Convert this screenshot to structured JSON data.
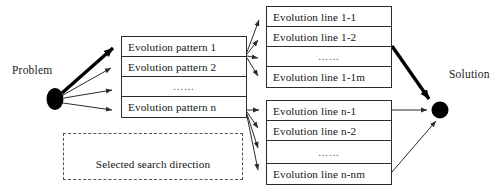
{
  "diagram": {
    "colors": {
      "stroke": "#2b2b2b",
      "thick_stroke": "#000000",
      "node_fill": "#000000",
      "legend_border": "#555555",
      "background": "#ffffff"
    },
    "nodes": {
      "problem": {
        "label": "Problem"
      },
      "solution": {
        "label": "Solution"
      }
    },
    "pattern_group": {
      "name": "evolution-pattern-group",
      "rows": [
        {
          "label": "Evolution pattern 1",
          "kind": "item"
        },
        {
          "label": "Evolution pattern 2",
          "kind": "item"
        },
        {
          "label": "……",
          "kind": "ellipsis"
        },
        {
          "label": "Evolution pattern n",
          "kind": "item"
        }
      ]
    },
    "line_group_top": {
      "name": "evolution-line-group-1",
      "rows": [
        {
          "label": "Evolution line 1-1",
          "kind": "item"
        },
        {
          "label": "Evolution line 1-2",
          "kind": "item"
        },
        {
          "label": "……",
          "kind": "ellipsis"
        },
        {
          "label": "Evolution line 1-1m",
          "kind": "item"
        }
      ]
    },
    "line_group_bottom": {
      "name": "evolution-line-group-n",
      "rows": [
        {
          "label": "Evolution line n-1",
          "kind": "item"
        },
        {
          "label": "Evolution line n-2",
          "kind": "item"
        },
        {
          "label": "……",
          "kind": "ellipsis"
        },
        {
          "label": "Evolution line n-nm",
          "kind": "item"
        }
      ]
    },
    "legend": {
      "caption": "Selected search direction"
    }
  }
}
